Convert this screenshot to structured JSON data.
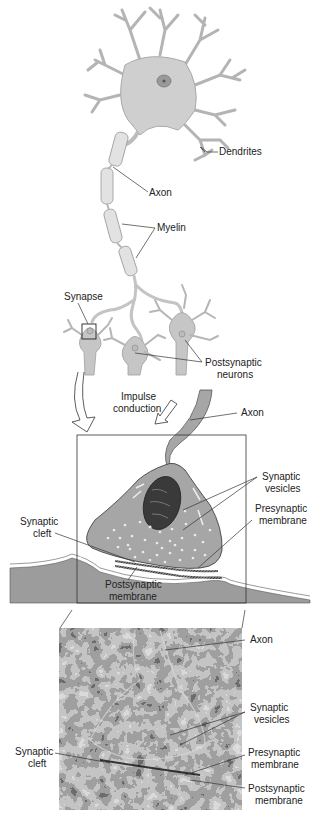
{
  "diagram": {
    "panels": [
      {
        "id": "neuron-overview",
        "description": "Neuron with dendrites, myelinated axon, and synapses onto postsynaptic neurons"
      },
      {
        "id": "synapse-schematic",
        "description": "Schematic enlargement of a synapse"
      },
      {
        "id": "synapse-micrograph",
        "description": "Electron micrograph of a synapse"
      }
    ],
    "labels": {
      "dendrites": "Dendrites",
      "axon": "Axon",
      "myelin": "Myelin",
      "synapse": "Synapse",
      "postsynaptic_neurons_1": "Postsynaptic",
      "postsynaptic_neurons_2": "neurons",
      "impulse_1": "Impulse",
      "impulse_2": "conduction",
      "schematic_axon": "Axon",
      "vesicles_1": "Synaptic",
      "vesicles_2": "vesicles",
      "cleft_1": "Synaptic",
      "cleft_2": "cleft",
      "presyn_1": "Presynaptic",
      "presyn_2": "membrane",
      "postsyn_1": "Postsynaptic",
      "postsyn_2": "membrane",
      "micro_axon": "Axon",
      "micro_vesicles_1": "Synaptic",
      "micro_vesicles_2": "vesicles",
      "micro_cleft_1": "Synaptic",
      "micro_cleft_2": "cleft",
      "micro_presyn_1": "Presynaptic",
      "micro_presyn_2": "membrane",
      "micro_postsyn_1": "Postsynaptic",
      "micro_postsyn_2": "membrane"
    },
    "colors": {
      "neuron_fill": "#cfcfcf",
      "neuron_stroke": "#9a9a9a",
      "terminal_fill": "#a6a6a6",
      "mitochondrion": "#3a3a3a",
      "tissue": "#9c9c9c",
      "micrograph_dark": "#1a1a1a",
      "micrograph_light": "#b8b8b8"
    }
  }
}
